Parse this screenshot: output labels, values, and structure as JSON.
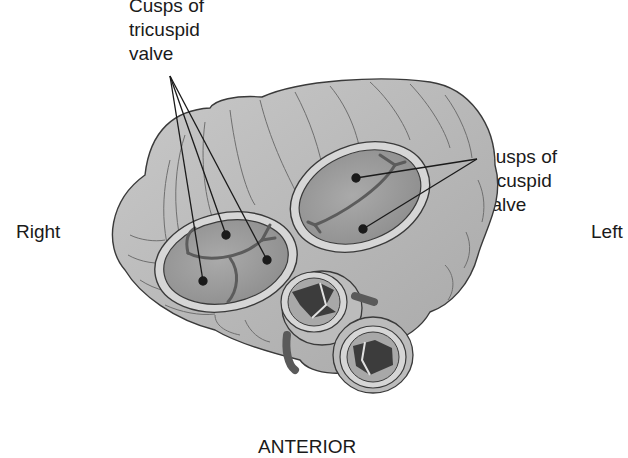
{
  "figure": {
    "type": "anatomical diagram",
    "colors": {
      "background": "#ffffff",
      "heart_tissue": "#b9b9b9",
      "valve_interior": "#9a9a9a",
      "valve_ring": "#d6d6d6",
      "outline": "#3a3a3a",
      "lumen_dark": "#3c3c3c",
      "label_text": "#1a1a1a"
    }
  },
  "labels": {
    "tricuspid": "Cusps of\ntricuspid\nvalve",
    "bicuspid": "Cusps of\nbicuspid\nvalve",
    "right": "Right",
    "left": "Left",
    "anterior": "ANTERIOR"
  },
  "callouts": {
    "tricuspid_points": 3,
    "bicuspid_points": 2
  }
}
